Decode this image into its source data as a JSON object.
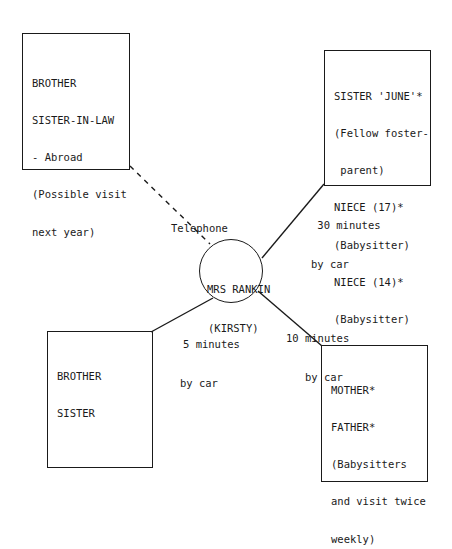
{
  "diagram": {
    "type": "ecomap",
    "center": {
      "line1": "MRS RANKIN",
      "line2": "(KIRSTY)"
    },
    "nodes": [
      {
        "id": "brother-sister-in-law",
        "lines": [
          "BROTHER",
          "SISTER-IN-LAW",
          "- Abroad",
          "(Possible visit",
          "next year)"
        ]
      },
      {
        "id": "sister-june-nieces",
        "lines": [
          "SISTER 'JUNE'*",
          "(Fellow foster-",
          " parent)",
          "NIECE (17)*",
          "(Babysitter)",
          "NIECE (14)*",
          "(Babysitter)"
        ]
      },
      {
        "id": "brother-sister",
        "lines": [
          "BROTHER",
          "SISTER"
        ]
      },
      {
        "id": "mother-father",
        "lines": [
          "MOTHER*",
          "FATHER*",
          "(Babysitters",
          "and visit twice",
          "weekly)"
        ]
      }
    ],
    "connections": [
      {
        "to": "brother-sister-in-law",
        "style": "dashed",
        "label": [
          "Telephone"
        ]
      },
      {
        "to": "sister-june-nieces",
        "style": "solid",
        "label": [
          " 30 minutes",
          "by car"
        ]
      },
      {
        "to": "brother-sister",
        "style": "solid",
        "label": [
          "5 minutes",
          "by car"
        ]
      },
      {
        "to": "mother-father",
        "style": "solid",
        "label": [
          "10 minutes",
          "   by car"
        ]
      }
    ],
    "colors": {
      "ink": "#1a1a1a",
      "background": "#ffffff"
    }
  }
}
